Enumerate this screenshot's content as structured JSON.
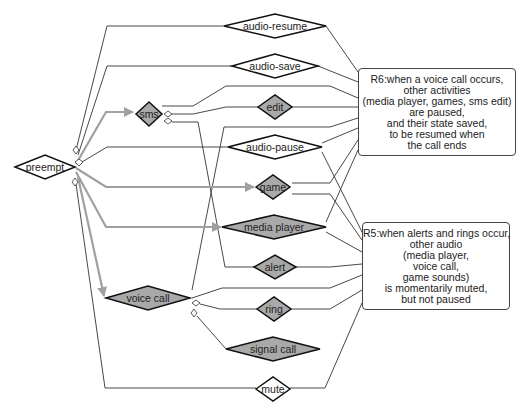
{
  "diagram": {
    "colors": {
      "line": "#333333",
      "arrow": "#a0a0a0",
      "filled_node": "#a9a9a9",
      "outline": "#111111"
    },
    "nodes": [
      {
        "id": "preempt",
        "label": "preempt",
        "filled": false
      },
      {
        "id": "audio-resume",
        "label": "audio-resume",
        "filled": false
      },
      {
        "id": "audio-save",
        "label": "audio-save",
        "filled": false
      },
      {
        "id": "sms",
        "label": "sms",
        "filled": true
      },
      {
        "id": "edit",
        "label": "edit",
        "filled": true
      },
      {
        "id": "audio-pause",
        "label": "audio-pause",
        "filled": false
      },
      {
        "id": "game",
        "label": "game",
        "filled": true
      },
      {
        "id": "media-player",
        "label": "media player",
        "filled": true
      },
      {
        "id": "alert",
        "label": "alert",
        "filled": true
      },
      {
        "id": "voice-call",
        "label": "voice call",
        "filled": true
      },
      {
        "id": "ring",
        "label": "ring",
        "filled": true
      },
      {
        "id": "signal-call",
        "label": "signal call",
        "filled": true
      },
      {
        "id": "mute",
        "label": "mute",
        "filled": false
      }
    ],
    "notes": {
      "r6": {
        "lines": [
          "R6:when a voice call occurs,",
          "other activities",
          "(media player, games, sms edit)",
          "are paused,",
          "and their state saved,",
          "to be resumed when",
          "the call ends"
        ]
      },
      "r5": {
        "lines": [
          "R5:when alerts and rings occur,",
          "other audio",
          "(media player,",
          "voice call,",
          "game sounds)",
          "is momentarily muted,",
          "but not paused"
        ]
      }
    },
    "edges": [
      {
        "from": "preempt",
        "to": "sms",
        "style": "arrow"
      },
      {
        "from": "preempt",
        "to": "game",
        "style": "arrow"
      },
      {
        "from": "preempt",
        "to": "media-player",
        "style": "arrow"
      },
      {
        "from": "preempt",
        "to": "voice-call",
        "style": "arrow"
      },
      {
        "from": "preempt",
        "to": "audio-resume",
        "style": "line"
      },
      {
        "from": "preempt",
        "to": "audio-save",
        "style": "line"
      },
      {
        "from": "preempt",
        "to": "audio-pause",
        "style": "line"
      },
      {
        "from": "preempt",
        "to": "mute",
        "style": "line"
      },
      {
        "from": "sms",
        "to": "edit",
        "style": "line"
      },
      {
        "from": "sms",
        "to": "alert",
        "style": "line"
      },
      {
        "from": "voice-call",
        "to": "ring",
        "style": "line"
      },
      {
        "from": "voice-call",
        "to": "signal-call",
        "style": "line"
      },
      {
        "from": "voice-call",
        "to": "r6",
        "style": "line"
      }
    ]
  }
}
